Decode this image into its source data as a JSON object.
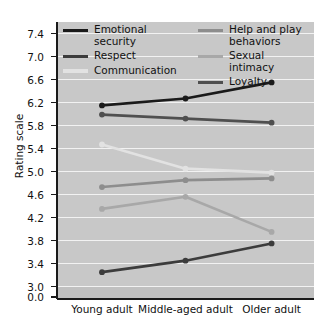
{
  "chart_data": {
    "type": "line",
    "title": "",
    "xlabel": "",
    "ylabel": "Rating scale",
    "categories": [
      "Young adult",
      "Middle-aged adult",
      "Older adult"
    ],
    "ylim": [
      3.0,
      7.6
    ],
    "yticks": [
      "0.0",
      "3.0",
      "3.4",
      "3.8",
      "4.2",
      "4.6",
      "5.0",
      "5.4",
      "5.8",
      "6.2",
      "6.6",
      "7.0",
      "7.4"
    ],
    "ytick_values": [
      0.0,
      3.0,
      3.4,
      3.8,
      4.2,
      4.6,
      5.0,
      5.4,
      5.8,
      6.2,
      6.6,
      7.0,
      7.4
    ],
    "axis_break": true,
    "grid": true,
    "legend_position": "top-inside",
    "plot_background": "#c8c8c8",
    "gridline_color": "#f2f2f2",
    "series": [
      {
        "name": "Emotional security",
        "values": [
          6.15,
          6.27,
          6.55
        ],
        "color": "#1a1a1a"
      },
      {
        "name": "Respect",
        "values": [
          3.25,
          3.45,
          3.75
        ],
        "color": "#3c3c3c"
      },
      {
        "name": "Communication",
        "values": [
          5.47,
          5.05,
          4.98
        ],
        "color": "#e2e2e2"
      },
      {
        "name": "Help and play behaviors",
        "values": [
          4.73,
          4.85,
          4.88
        ],
        "color": "#8d8d8d"
      },
      {
        "name": "Sexual intimacy",
        "values": [
          4.35,
          4.56,
          3.95
        ],
        "color": "#a8a8a8"
      },
      {
        "name": "Loyalty",
        "values": [
          5.99,
          5.92,
          5.85
        ],
        "color": "#4f4f4f"
      }
    ]
  },
  "legend": {
    "left_column": [
      "Emotional security",
      "Respect",
      "Communication"
    ],
    "right_column": [
      "Help and play behaviors",
      "Sexual intimacy",
      "Loyalty"
    ]
  }
}
